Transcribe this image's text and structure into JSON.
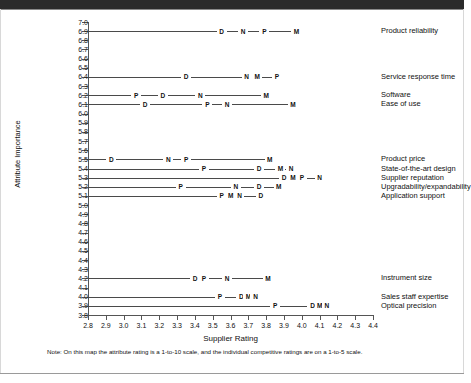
{
  "chart_data": {
    "type": "scatter",
    "title": "",
    "xlabel": "Supplier Rating",
    "ylabel": "Attribute Importance",
    "xlim": [
      2.8,
      4.4
    ],
    "ylim": [
      3.8,
      7.0
    ],
    "x_ticks": [
      "2.8",
      "2.9",
      "3.0",
      "3.1",
      "3.2",
      "3.3",
      "3.4",
      "3.5",
      "3.6",
      "3.7",
      "3.8",
      "3.9",
      "4.0",
      "4.1",
      "4.2",
      "4.3",
      "4.4"
    ],
    "y_ticks": [
      "7.0",
      "6.9",
      "6.8",
      "6.7",
      "6.6",
      "6.5",
      "6.4",
      "6.3",
      "6.2",
      "6.1",
      "6.0",
      "5.9",
      "5.8",
      "5.7",
      "5.6",
      "5.5",
      "5.4",
      "5.3",
      "5.2",
      "5.1",
      "5.0",
      "4.9",
      "4.8",
      "4.7",
      "4.6",
      "4.5",
      "4.4",
      "4.3",
      "4.2",
      "4.1",
      "4.0",
      "3.9",
      "3.8"
    ],
    "grid": false,
    "legend_position": "right-labels",
    "series_names": [
      "D",
      "N",
      "P",
      "M"
    ],
    "rows": [
      {
        "label": "Product reliability",
        "y": 6.9,
        "points": [
          {
            "m": "D",
            "x": 3.55
          },
          {
            "m": "N",
            "x": 3.67
          },
          {
            "m": "P",
            "x": 3.79
          },
          {
            "m": "M",
            "x": 3.97
          }
        ]
      },
      {
        "label": "Service response time",
        "y": 6.4,
        "points": [
          {
            "m": "D",
            "x": 3.35
          },
          {
            "m": "N",
            "x": 3.69
          },
          {
            "m": "M",
            "x": 3.75
          },
          {
            "m": "P",
            "x": 3.86
          }
        ]
      },
      {
        "label": "Software",
        "y": 6.2,
        "points": [
          {
            "m": "P",
            "x": 3.07
          },
          {
            "m": "D",
            "x": 3.22
          },
          {
            "m": "N",
            "x": 3.43
          },
          {
            "m": "M",
            "x": 3.8
          }
        ]
      },
      {
        "label": "Ease of use",
        "y": 6.1,
        "points": [
          {
            "m": "D",
            "x": 3.12
          },
          {
            "m": "P",
            "x": 3.47
          },
          {
            "m": "N",
            "x": 3.58
          },
          {
            "m": "M",
            "x": 3.95
          }
        ]
      },
      {
        "label": "Product price",
        "y": 5.5,
        "points": [
          {
            "m": "D",
            "x": 2.93
          },
          {
            "m": "N",
            "x": 3.25
          },
          {
            "m": "P",
            "x": 3.35
          },
          {
            "m": "M",
            "x": 3.82
          }
        ]
      },
      {
        "label": "State-of-the-art design",
        "y": 5.4,
        "points": [
          {
            "m": "P",
            "x": 3.45
          },
          {
            "m": "D",
            "x": 3.76
          },
          {
            "m": "M",
            "x": 3.88
          },
          {
            "m": "N",
            "x": 3.94
          }
        ]
      },
      {
        "label": "Supplier reputation",
        "y": 5.3,
        "points": [
          {
            "m": "D",
            "x": 3.9
          },
          {
            "m": "M",
            "x": 3.95
          },
          {
            "m": "P",
            "x": 4.0
          },
          {
            "m": "N",
            "x": 4.1
          }
        ]
      },
      {
        "label": "Upgradability/expandability",
        "y": 5.2,
        "points": [
          {
            "m": "P",
            "x": 3.32
          },
          {
            "m": "N",
            "x": 3.63
          },
          {
            "m": "D",
            "x": 3.76
          },
          {
            "m": "M",
            "x": 3.87
          }
        ]
      },
      {
        "label": "Application support",
        "y": 5.1,
        "points": [
          {
            "m": "P",
            "x": 3.55
          },
          {
            "m": "M",
            "x": 3.6
          },
          {
            "m": "N",
            "x": 3.65
          },
          {
            "m": "D",
            "x": 3.77
          }
        ]
      },
      {
        "label": "Instrument size",
        "y": 4.2,
        "points": [
          {
            "m": "D",
            "x": 3.4
          },
          {
            "m": "P",
            "x": 3.45
          },
          {
            "m": "N",
            "x": 3.58
          },
          {
            "m": "M",
            "x": 3.81
          }
        ]
      },
      {
        "label": "Sales staff expertise",
        "y": 4.0,
        "points": [
          {
            "m": "P",
            "x": 3.54
          },
          {
            "m": "D",
            "x": 3.66
          },
          {
            "m": "M",
            "x": 3.7
          },
          {
            "m": "N",
            "x": 3.74
          }
        ]
      },
      {
        "label": "Optical precision",
        "y": 3.9,
        "points": [
          {
            "m": "P",
            "x": 3.85
          },
          {
            "m": "D",
            "x": 4.06
          },
          {
            "m": "M",
            "x": 4.1
          },
          {
            "m": "N",
            "x": 4.14
          }
        ]
      }
    ]
  },
  "footnote": "Note: On this map the attribute rating is a 1-to-10 scale, and the individual competitive ratings are on a 1-to-5 scale."
}
